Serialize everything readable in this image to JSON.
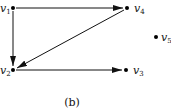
{
  "diagram": {
    "type": "directed-graph",
    "caption": "(b)",
    "nodes": [
      {
        "id": "v1",
        "label": "v",
        "sub": "1",
        "x": 13,
        "y": 8
      },
      {
        "id": "v2",
        "label": "v",
        "sub": "2",
        "x": 13,
        "y": 70
      },
      {
        "id": "v3",
        "label": "v",
        "sub": "3",
        "x": 126,
        "y": 70
      },
      {
        "id": "v4",
        "label": "v",
        "sub": "4",
        "x": 127,
        "y": 8
      },
      {
        "id": "v5",
        "label": "v",
        "sub": "5",
        "x": 156,
        "y": 37
      }
    ],
    "edges": [
      {
        "from": "v1",
        "to": "v4"
      },
      {
        "from": "v1",
        "to": "v2"
      },
      {
        "from": "v4",
        "to": "v2"
      },
      {
        "from": "v2",
        "to": "v3"
      }
    ]
  }
}
